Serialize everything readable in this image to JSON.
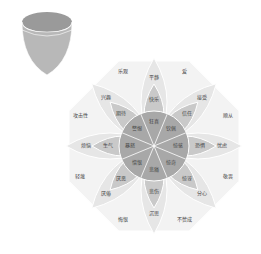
{
  "colors": {
    "outer": "#e6e6e6",
    "mid": "#c9c9c9",
    "inner": "#a8a8a8",
    "core": "#8c8c8c",
    "bg": "#f3f3f3",
    "stroke": "#ffffff"
  },
  "petals": [
    {
      "mild": "平静",
      "basic": "快乐",
      "intense": "狂喜"
    },
    {
      "mild": "接受",
      "basic": "信任",
      "intense": "钦佩"
    },
    {
      "mild": "忧虑",
      "basic": "恐惧",
      "intense": "惊骇"
    },
    {
      "mild": "分心",
      "basic": "惊讶",
      "intense": "惊奇"
    },
    {
      "mild": "沉思",
      "basic": "悲伤",
      "intense": "悲痛"
    },
    {
      "mild": "厌倦",
      "basic": "厌恶",
      "intense": "憎恨"
    },
    {
      "mild": "烦恼",
      "basic": "生气",
      "intense": "暴怒"
    },
    {
      "mild": "兴趣",
      "basic": "期待",
      "intense": "警惕"
    }
  ],
  "dyads": [
    "爱",
    "顺从",
    "敬畏",
    "不赞成",
    "悔恨",
    "轻蔑",
    "攻击性",
    "乐观"
  ]
}
